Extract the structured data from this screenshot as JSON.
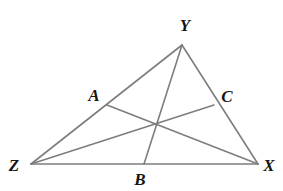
{
  "figure": {
    "name": "triangle-with-medians",
    "background_color": "#ffffff",
    "line_color": "#7d7d7d",
    "line_width": 1.6,
    "label_color": "#141414",
    "canvas": {
      "width": 283,
      "height": 191
    }
  },
  "points": {
    "Y": {
      "label": "Y",
      "x": 182,
      "y": 45,
      "label_x": 185,
      "label_y": 25
    },
    "Z": {
      "label": "Z",
      "x": 31,
      "y": 164,
      "label_x": 14,
      "label_y": 165
    },
    "X": {
      "label": "X",
      "x": 258,
      "y": 164,
      "label_x": 269,
      "label_y": 165
    },
    "A": {
      "label": "A",
      "x": 107,
      "y": 105,
      "label_x": 94,
      "label_y": 95
    },
    "B": {
      "label": "B",
      "x": 144,
      "y": 164,
      "label_x": 140,
      "label_y": 179
    },
    "C": {
      "label": "C",
      "x": 214,
      "y": 105,
      "label_x": 227,
      "label_y": 96
    },
    "centroid": {
      "label": "",
      "x": 157,
      "y": 124
    }
  },
  "segments": [
    {
      "name": "side-ZY",
      "from": "Z",
      "to": "Y"
    },
    {
      "name": "side-YX",
      "from": "Y",
      "to": "X"
    },
    {
      "name": "side-ZX",
      "from": "Z",
      "to": "X"
    },
    {
      "name": "median-YB",
      "from": "Y",
      "to": "B"
    },
    {
      "name": "median-ZC",
      "from": "Z",
      "to": "C"
    },
    {
      "name": "median-XA",
      "from": "X",
      "to": "A"
    }
  ],
  "labels": {
    "Y": "Y",
    "Z": "Z",
    "X": "X",
    "A": "A",
    "B": "B",
    "C": "C"
  }
}
